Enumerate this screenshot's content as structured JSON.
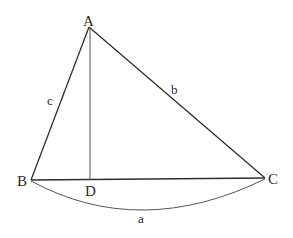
{
  "diagram": {
    "type": "triangle-with-altitude",
    "colors": {
      "stroke": "#2e2e2e",
      "text": "#2a2a2a",
      "background": "#ffffff"
    },
    "points": {
      "A": {
        "label": "A",
        "x": 89,
        "y": 27
      },
      "B": {
        "label": "B",
        "x": 31,
        "y": 180
      },
      "C": {
        "label": "C",
        "x": 265,
        "y": 178
      },
      "D": {
        "label": "D",
        "x": 90,
        "y": 180
      }
    },
    "segments": [
      {
        "from": "A",
        "to": "B",
        "label": "c"
      },
      {
        "from": "A",
        "to": "C",
        "label": "b"
      },
      {
        "from": "B",
        "to": "C",
        "label": ""
      },
      {
        "from": "A",
        "to": "D",
        "label": ""
      }
    ],
    "brace": {
      "from": "B",
      "to": "C",
      "label": "a"
    },
    "labels": {
      "vertex_a": "A",
      "vertex_b": "B",
      "vertex_c": "C",
      "foot_d": "D",
      "side_a": "a",
      "side_b": "b",
      "side_c": "c"
    }
  }
}
